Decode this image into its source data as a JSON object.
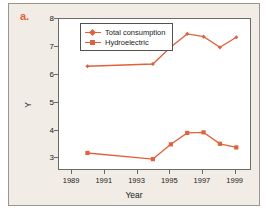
{
  "panel": {
    "label": "a."
  },
  "chart_data": {
    "type": "line",
    "title": "",
    "xlabel": "Year",
    "ylabel": "Y",
    "xlim": [
      1988.2,
      2000.0
    ],
    "ylim": [
      2.55,
      8.0
    ],
    "xticks": [
      1989,
      1991,
      1993,
      1995,
      1997,
      1999
    ],
    "yticks": [
      3,
      4,
      5,
      6,
      7,
      8
    ],
    "grid": false,
    "legend_position": "top-left-inside",
    "series": [
      {
        "name": "Total consumption",
        "color": "#e0613c",
        "marker": "diamond",
        "x": [
          1990.0,
          1994.0,
          1995.1,
          1996.1,
          1997.1,
          1998.1,
          1999.1
        ],
        "values": [
          6.27,
          6.35,
          6.96,
          7.43,
          7.33,
          6.95,
          7.31
        ]
      },
      {
        "name": "Hydroelectric",
        "color": "#e0613c",
        "marker": "square",
        "x": [
          1990.0,
          1994.0,
          1995.1,
          1996.1,
          1997.1,
          1998.1,
          1999.1
        ],
        "values": [
          3.16,
          2.94,
          3.47,
          3.88,
          3.9,
          3.49,
          3.36
        ]
      }
    ]
  }
}
